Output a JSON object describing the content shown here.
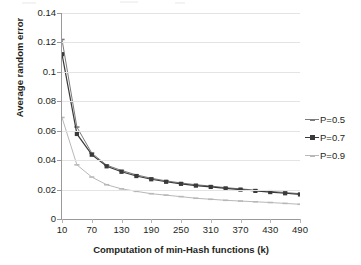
{
  "chart_data": {
    "type": "line",
    "title": "",
    "xlabel": "Computation of min-Hash functions (k)",
    "ylabel": "Average random error",
    "xlim": [
      10,
      490
    ],
    "ylim": [
      0,
      0.14
    ],
    "grid": true,
    "legend_position": "right",
    "x_ticks": [
      "10",
      "70",
      "130",
      "190",
      "250",
      "310",
      "370",
      "430",
      "490"
    ],
    "y_ticks": [
      "0",
      "0.02",
      "0.04",
      "0.06",
      "0.08",
      "0.1",
      "0.12",
      "0.14"
    ],
    "x": [
      10,
      40,
      70,
      100,
      130,
      160,
      190,
      220,
      250,
      280,
      310,
      340,
      370,
      400,
      430,
      460,
      490
    ],
    "series": [
      {
        "name": "P=0.5",
        "marker": "dash",
        "color": "#7b7b7b",
        "values": [
          0.122,
          0.0625,
          0.0448,
          0.0366,
          0.033,
          0.03,
          0.0277,
          0.0259,
          0.0245,
          0.0233,
          0.0224,
          0.0213,
          0.0205,
          0.0196,
          0.0188,
          0.018,
          0.0172
        ]
      },
      {
        "name": "P=0.7",
        "marker": "square",
        "color": "#3a3a3a",
        "values": [
          0.112,
          0.0578,
          0.0437,
          0.0358,
          0.0321,
          0.0292,
          0.027,
          0.0253,
          0.0239,
          0.0227,
          0.0218,
          0.0208,
          0.02,
          0.0191,
          0.0183,
          0.0175,
          0.0167
        ]
      },
      {
        "name": "P=0.9",
        "marker": "dash",
        "color": "#b8b8b8",
        "values": [
          0.069,
          0.0368,
          0.0285,
          0.0233,
          0.0205,
          0.0188,
          0.0172,
          0.0162,
          0.0152,
          0.0141,
          0.0134,
          0.0127,
          0.0122,
          0.0117,
          0.0112,
          0.0106,
          0.01
        ]
      }
    ]
  },
  "legend": {
    "items": [
      {
        "label": "P=0.5"
      },
      {
        "label": "P=0.7"
      },
      {
        "label": "P=0.9"
      }
    ]
  }
}
